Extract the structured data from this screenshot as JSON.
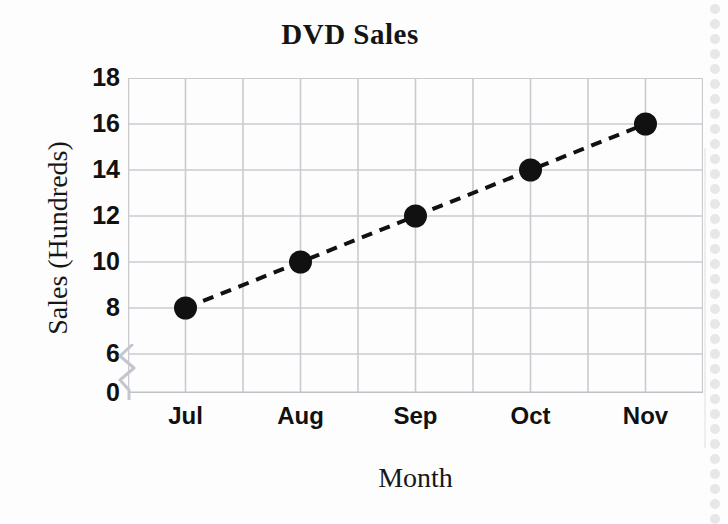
{
  "chart_data": {
    "type": "line",
    "title": "DVD Sales",
    "xlabel": "Month",
    "ylabel": "Sales (Hundreds)",
    "categories": [
      "Jul",
      "Aug",
      "Sep",
      "Oct",
      "Nov"
    ],
    "values": [
      8,
      10,
      12,
      14,
      16
    ],
    "series": [
      {
        "name": "DVD Sales",
        "values": [
          8,
          10,
          12,
          14,
          16
        ]
      }
    ],
    "ylim": [
      0,
      18
    ],
    "y_ticks": [
      0,
      6,
      8,
      10,
      12,
      14,
      16,
      18
    ],
    "y_tick_labels": [
      "0",
      "6",
      "8",
      "10",
      "12",
      "14",
      "16",
      "18"
    ],
    "y_axis_break": true,
    "y_axis_break_between": [
      0,
      6
    ],
    "grid": true,
    "legend": "none",
    "line_style": "dashed",
    "marker": "circle",
    "marker_color": "#111111",
    "line_color": "#111111",
    "grid_color": "#c8cbd0",
    "background_color": "#fdfdfd"
  },
  "figure": {
    "title": "DVD Sales",
    "x_axis_title": "Month",
    "y_axis_title": "Sales (Hundreds)"
  }
}
